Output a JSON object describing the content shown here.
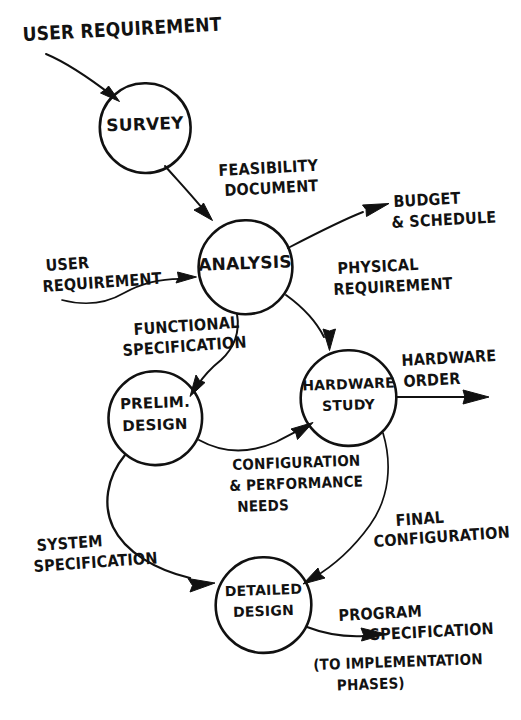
{
  "diagram": {
    "style": "hand-drawn",
    "ink_color": "#111111",
    "paper_color": "#ffffff",
    "width": 521,
    "height": 720,
    "nodes": [
      {
        "id": "survey",
        "label": "SURVEY",
        "cx": 145,
        "cy": 128,
        "r": 45,
        "lines": [
          "SURVEY"
        ]
      },
      {
        "id": "analysis",
        "label": "ANALYSIS",
        "cx": 245,
        "cy": 267,
        "r": 47,
        "lines": [
          "ANALYSIS"
        ]
      },
      {
        "id": "prelim",
        "label": "PRELIM. DESIGN",
        "cx": 155,
        "cy": 418,
        "r": 47,
        "lines": [
          "PRELIM.",
          "DESIGN"
        ]
      },
      {
        "id": "hardware",
        "label": "HARDWARE STUDY",
        "cx": 348,
        "cy": 398,
        "r": 48,
        "lines": [
          "HARDWARE",
          "STUDY"
        ]
      },
      {
        "id": "detailed",
        "label": "DETAILED DESIGN",
        "cx": 263,
        "cy": 605,
        "r": 48,
        "lines": [
          "DETAILED",
          "DESIGN"
        ]
      }
    ],
    "flow_labels": [
      {
        "id": "user-requirement-top",
        "text": "USER REQUIREMENT",
        "lines": [
          "USER REQUIREMENT"
        ],
        "x": 22,
        "y": 24,
        "size": 19,
        "rotate": -3
      },
      {
        "id": "feasibility-document",
        "text": "FEASIBILITY DOCUMENT",
        "lines": [
          "FEASIBILITY",
          "DOCUMENT"
        ],
        "x": 218,
        "y": 163,
        "size": 16,
        "rotate": -2
      },
      {
        "id": "budget-schedule",
        "text": "BUDGET & SCHEDULE",
        "lines": [
          "BUDGET",
          "& SCHEDULE"
        ],
        "x": 393,
        "y": 194,
        "size": 16,
        "rotate": -2
      },
      {
        "id": "user-requirement-left",
        "text": "USER REQUIREMENT",
        "lines": [
          "USER",
          "REQUIREMENT"
        ],
        "x": 45,
        "y": 258,
        "size": 16,
        "rotate": -3
      },
      {
        "id": "physical-requirement",
        "text": "PHYSICAL REQUIREMENT",
        "lines": [
          "PHYSICAL",
          "REQUIREMENT"
        ],
        "x": 337,
        "y": 261,
        "size": 16,
        "rotate": -2
      },
      {
        "id": "functional-spec",
        "text": "FUNCTIONAL SPECIFICATION",
        "lines": [
          "FUNCTIONAL",
          "SPECIFICATION"
        ],
        "x": 130,
        "y": 322,
        "size": 16,
        "rotate": -3
      },
      {
        "id": "hardware-order",
        "text": "HARDWARE ORDER",
        "lines": [
          "HARDWARE",
          "ORDER"
        ],
        "x": 401,
        "y": 353,
        "size": 16,
        "rotate": -2
      },
      {
        "id": "config-performance",
        "text": "CONFIGURATION & PERFORMANCE NEEDS",
        "lines": [
          "CONFIGURATION",
          "& PERFORMANCE",
          "NEEDS"
        ],
        "x": 232,
        "y": 458,
        "size": 16,
        "rotate": -1
      },
      {
        "id": "final-configuration",
        "text": "FINAL CONFIGURATION",
        "lines": [
          "FINAL",
          "CONFIGURATION"
        ],
        "x": 388,
        "y": 513,
        "size": 16,
        "rotate": -3
      },
      {
        "id": "system-specification",
        "text": "SYSTEM SPECIFICATION",
        "lines": [
          "SYSTEM",
          "SPECIFICATION"
        ],
        "x": 33,
        "y": 538,
        "size": 16,
        "rotate": -3
      },
      {
        "id": "program-specification",
        "text": "PROGRAM SPECIFICATION",
        "lines": [
          "PROGRAM",
          "      SPECIFICATION"
        ],
        "x": 338,
        "y": 608,
        "size": 16,
        "rotate": -2
      },
      {
        "id": "to-implementation",
        "text": "(TO IMPLEMENTATION PHASES)",
        "lines": [
          "(TO IMPLEMENTATION",
          "   PHASES)"
        ],
        "x": 313,
        "y": 655,
        "size": 16,
        "rotate": -1
      }
    ],
    "edges": [
      {
        "id": "edge-user-req-to-survey",
        "from": "user-requirement-top",
        "to": "survey",
        "label": "USER REQUIREMENT"
      },
      {
        "id": "edge-survey-to-analysis",
        "from": "survey",
        "to": "analysis",
        "label": "FEASIBILITY DOCUMENT"
      },
      {
        "id": "edge-user-req-to-analysis",
        "from": "user-requirement-left",
        "to": "analysis",
        "label": "USER REQUIREMENT"
      },
      {
        "id": "edge-analysis-to-budget",
        "from": "analysis",
        "to": "budget-schedule",
        "label": "BUDGET & SCHEDULE"
      },
      {
        "id": "edge-analysis-to-hardware",
        "from": "analysis",
        "to": "hardware",
        "label": "PHYSICAL REQUIREMENT"
      },
      {
        "id": "edge-analysis-to-prelim",
        "from": "analysis",
        "to": "prelim",
        "label": "FUNCTIONAL SPECIFICATION"
      },
      {
        "id": "edge-hardware-to-order",
        "from": "hardware",
        "to": "hardware-order",
        "label": "HARDWARE ORDER"
      },
      {
        "id": "edge-prelim-to-hardware",
        "from": "prelim",
        "to": "hardware",
        "label": "CONFIGURATION & PERFORMANCE NEEDS"
      },
      {
        "id": "edge-hardware-to-detailed",
        "from": "hardware",
        "to": "detailed",
        "label": "FINAL CONFIGURATION"
      },
      {
        "id": "edge-prelim-to-detailed",
        "from": "prelim",
        "to": "detailed",
        "label": "SYSTEM SPECIFICATION"
      },
      {
        "id": "edge-detailed-to-program",
        "from": "detailed",
        "to": "program-specification",
        "label": "PROGRAM SPECIFICATION"
      }
    ]
  }
}
